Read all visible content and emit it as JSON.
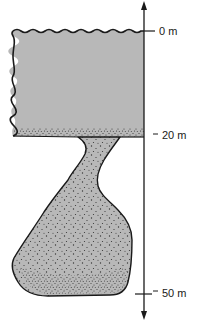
{
  "diagram": {
    "type": "depth-profile",
    "axis": {
      "orientation": "vertical",
      "direction": "bidirectional-arrow",
      "unit": "m",
      "ticks": [
        {
          "value": 0,
          "label": "0 m"
        },
        {
          "value": 20,
          "label": "20 m"
        },
        {
          "value": 50,
          "label": "50 m"
        }
      ]
    },
    "regions": [
      {
        "name": "upper-layer",
        "description": "uniform gray block from 0 m to 20 m with wavy top surface and wavy left edge",
        "fill": "#b8b8b8"
      },
      {
        "name": "neck",
        "description": "stippled narrow channel below 20 m curving down-left",
        "fill": "#b8b8b8"
      },
      {
        "name": "lower-body",
        "description": "stippled irregular rounded mass extending to about 50 m",
        "fill": "#b8b8b8"
      }
    ],
    "colors": {
      "outline": "#1a1a1a",
      "fill": "#b8b8b8",
      "stipple": "#333333",
      "background": "#ffffff"
    }
  }
}
